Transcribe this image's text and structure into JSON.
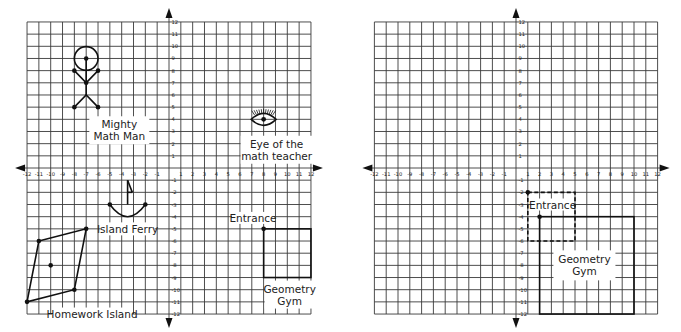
{
  "chart_data": [
    {
      "type": "scatter",
      "title": "Coordinate plane with figures",
      "xlim": [
        -12,
        12
      ],
      "ylim": [
        -12,
        12
      ],
      "grid": true,
      "x_ticks": [
        -12,
        -11,
        -10,
        -9,
        -8,
        -7,
        -6,
        -5,
        -4,
        -3,
        -2,
        -1,
        1,
        2,
        3,
        4,
        5,
        6,
        7,
        8,
        9,
        10,
        11,
        12
      ],
      "y_ticks": [
        -12,
        -11,
        -10,
        -9,
        -8,
        -7,
        -6,
        -5,
        -4,
        -3,
        -2,
        -1,
        1,
        2,
        3,
        4,
        5,
        6,
        7,
        8,
        9,
        10,
        11,
        12
      ],
      "figures": [
        {
          "name": "Mighty Math Man",
          "label": "Mighty\nMath Man",
          "head_center": [
            -7,
            9
          ],
          "head_radius": 1,
          "points": [
            [
              -7,
              9
            ],
            [
              -8,
              8
            ],
            [
              -6,
              8
            ],
            [
              -7,
              7
            ],
            [
              -8,
              5
            ],
            [
              -6,
              5
            ]
          ]
        },
        {
          "name": "Eye of the math teacher",
          "label": "Eye of the\nmath teacher",
          "center": [
            8,
            4
          ],
          "x_extent": [
            7,
            9
          ]
        },
        {
          "name": "Island Ferry",
          "label": "Island Ferry",
          "points": [
            [
              -5,
              -3
            ],
            [
              -2,
              -3
            ]
          ],
          "mast_x": -3.5,
          "mast_y": [
            -1,
            -3
          ]
        },
        {
          "name": "Homework Island",
          "label": "Homework Island",
          "polygon": [
            [
              -11,
              -6
            ],
            [
              -7,
              -5
            ],
            [
              -8,
              -10
            ],
            [
              -12,
              -11
            ]
          ],
          "center": [
            -10,
            -8
          ]
        },
        {
          "name": "Geometry Gym",
          "label": "Geometry\nGym",
          "rect": {
            "x1": 8,
            "y1": -5,
            "x2": 12,
            "y2": -9
          },
          "entrance": [
            8,
            -5
          ],
          "entrance_label": "Entrance"
        }
      ]
    },
    {
      "type": "scatter",
      "title": "Coordinate plane with Geometry Gym",
      "xlim": [
        -12,
        12
      ],
      "ylim": [
        -12,
        12
      ],
      "grid": true,
      "x_ticks": [
        -12,
        -11,
        -10,
        -9,
        -8,
        -7,
        -6,
        -5,
        -4,
        -3,
        -2,
        -1,
        1,
        2,
        3,
        4,
        5,
        6,
        7,
        8,
        9,
        10,
        11,
        12
      ],
      "y_ticks": [
        -12,
        -11,
        -10,
        -9,
        -8,
        -7,
        -6,
        -5,
        -4,
        -3,
        -2,
        -1,
        1,
        2,
        3,
        4,
        5,
        6,
        7,
        8,
        9,
        10,
        11,
        12
      ],
      "figures": [
        {
          "name": "Original position (dashed)",
          "rect": {
            "x1": 1,
            "y1": -2,
            "x2": 5,
            "y2": -6
          },
          "style": "dashed",
          "vertex": [
            1,
            -2
          ],
          "label": "Entrance"
        },
        {
          "name": "Geometry Gym",
          "label": "Geometry\nGym",
          "rect": {
            "x1": 2,
            "y1": -4,
            "x2": 10,
            "y2": -12
          },
          "style": "solid",
          "entrance": [
            2,
            -4
          ]
        }
      ]
    }
  ],
  "left": {
    "labels": {
      "math_man_1": "Mighty",
      "math_man_2": "Math Man",
      "eye_1": "Eye of the",
      "eye_2": "math teacher",
      "ferry": "Island Ferry",
      "island": "Homework Island",
      "entrance": "Entrance",
      "gym_1": "Geometry",
      "gym_2": "Gym"
    }
  },
  "right": {
    "labels": {
      "entrance": "Entrance",
      "gym_1": "Geometry",
      "gym_2": "Gym"
    }
  }
}
